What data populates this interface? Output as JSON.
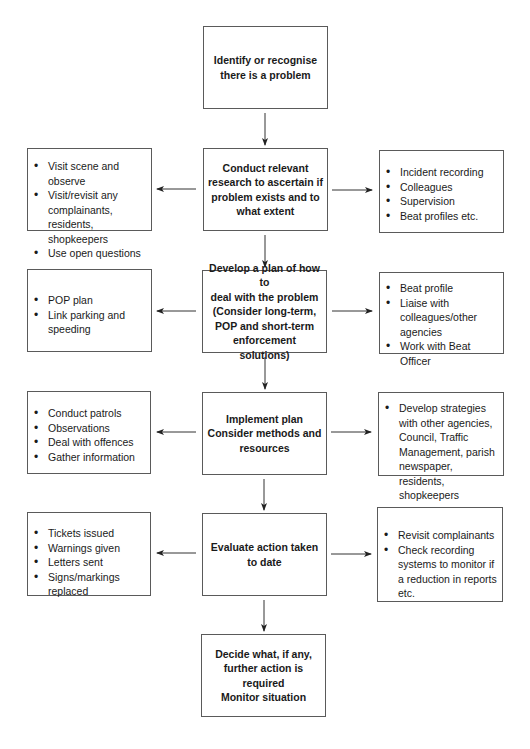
{
  "diagram": {
    "start": {
      "lines": [
        "Identify or recognise",
        "there is a problem"
      ]
    },
    "steps": [
      {
        "center": [
          "Conduct relevant",
          "research to ascertain if",
          "problem exists and to",
          "what extent"
        ],
        "left": [
          "Visit scene and observe",
          "Visit/revisit any complainants, residents, shopkeepers",
          "Use open questions"
        ],
        "right": [
          "Incident recording",
          "Colleagues",
          "Supervision",
          "Beat profiles etc."
        ]
      },
      {
        "center": [
          "Develop a plan of how to",
          "deal with the problem",
          "(Consider long-term,",
          "POP and short-term",
          "enforcement solutions)"
        ],
        "left": [
          "POP plan",
          "Link parking and speeding"
        ],
        "right": [
          "Beat profile",
          "Liaise with colleagues/other agencies",
          "Work with Beat Officer"
        ]
      },
      {
        "center": [
          "Implement plan",
          "Consider methods and",
          "resources"
        ],
        "left": [
          "Conduct patrols",
          "Observations",
          "Deal with offences",
          "Gather information"
        ],
        "right": [
          "Develop strategies with other agencies, Council, Traffic Management, parish newspaper, residents, shopkeepers"
        ]
      },
      {
        "center": [
          "Evaluate action taken",
          "to date"
        ],
        "left": [
          "Tickets issued",
          "Warnings given",
          "Letters sent",
          "Signs/markings replaced"
        ],
        "right": [
          "Revisit complainants",
          "Check recording systems to monitor if a reduction in reports etc."
        ]
      }
    ],
    "end": {
      "lines": [
        "Decide what, if any,",
        "further action is required",
        "Monitor situation"
      ]
    },
    "colors": {
      "border": "#5a5a5a",
      "text": "#1a1a1a",
      "arrow": "#222222",
      "background": "#ffffff"
    }
  }
}
